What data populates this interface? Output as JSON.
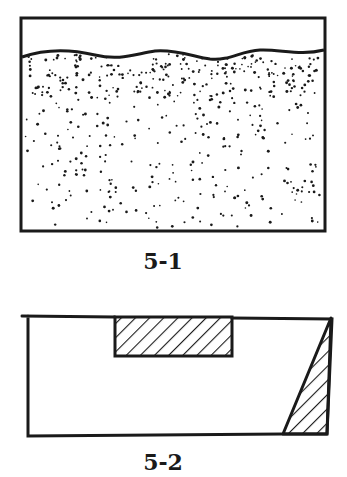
{
  "figures": [
    {
      "id": "5-1",
      "label": "5-1",
      "description": "Rectangular container with clear upper layer separated by a wavy line from a stippled (dotted) lower layer",
      "rect": {
        "x1": 21,
        "y1": 18,
        "x2": 325,
        "y2": 231
      },
      "fill_pattern": "stipple",
      "boundary": "wavy-line"
    },
    {
      "id": "5-2",
      "label": "5-2",
      "description": "Rectangle with a hatched rectangular notch along the top edge and a hatched right-triangle wedge on the right side",
      "rect": {
        "x1": 22,
        "y1": 315,
        "x2": 332,
        "y2": 436
      },
      "hatched_regions": [
        {
          "shape": "rectangle",
          "x1": 115,
          "y1": 317,
          "x2": 232,
          "y2": 356
        },
        {
          "shape": "triangle",
          "points": [
            [
              331,
              318
            ],
            [
              283,
              434
            ],
            [
              327,
              434
            ]
          ]
        }
      ],
      "fill_pattern": "diagonal-hatch"
    }
  ],
  "colors": {
    "ink": "#1a1a1a",
    "background": "#ffffff"
  }
}
